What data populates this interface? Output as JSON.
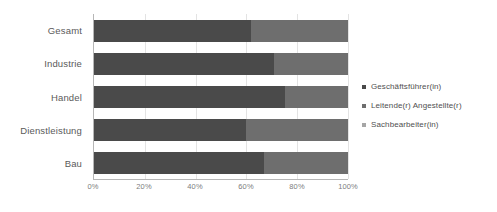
{
  "chart_data": {
    "type": "bar",
    "subtype": "stacked-horizontal-100pct",
    "title": "",
    "xlabel": "",
    "ylabel": "",
    "categories": [
      "Gesamt",
      "Industrie",
      "Handel",
      "Dienstleistung",
      "Bau"
    ],
    "series": [
      {
        "name": "Geschäftsführer(in)",
        "color": "#4a4a4a",
        "values": [
          62,
          71,
          75,
          60,
          67
        ]
      },
      {
        "name": "Leitende(r) Angestellte(r)",
        "color": "#6e6e6e",
        "values": [
          38,
          29,
          25,
          40,
          33
        ]
      },
      {
        "name": "Sachbearbeiter(in)",
        "color": "#a6a6a6",
        "values": [
          0,
          0,
          0,
          0,
          0
        ]
      }
    ],
    "xlim": [
      0,
      100
    ],
    "xticks": [
      0,
      20,
      40,
      60,
      80,
      100
    ],
    "xticklabels": [
      "0%",
      "20%",
      "40%",
      "60%",
      "80%",
      "100%"
    ],
    "grid": true,
    "grid_axis": "x",
    "legend_position": "right"
  },
  "axis": {
    "value_ticks": [
      {
        "label": "0%",
        "pct": 0
      },
      {
        "label": "20%",
        "pct": 20
      },
      {
        "label": "40%",
        "pct": 40
      },
      {
        "label": "60%",
        "pct": 60
      },
      {
        "label": "80%",
        "pct": 80
      },
      {
        "label": "100%",
        "pct": 100
      }
    ]
  },
  "legend": {
    "items": [
      {
        "label": "Geschäftsführer(in)",
        "color": "#4a4a4a"
      },
      {
        "label": "Leitende(r) Angestellte(r)",
        "color": "#6e6e6e"
      },
      {
        "label": "Sachbearbeiter(in)",
        "color": "#a6a6a6"
      }
    ]
  },
  "colors": {
    "series_1": "#4a4a4a",
    "series_2": "#6e6e6e",
    "series_3": "#a6a6a6",
    "gridline": "#e3e3e3",
    "axis_line": "#b6b6b6",
    "category_text": "#5a5a5a",
    "tick_text": "#7d7d7d",
    "legend_text": "#4f4f4f",
    "background": "#ffffff"
  }
}
